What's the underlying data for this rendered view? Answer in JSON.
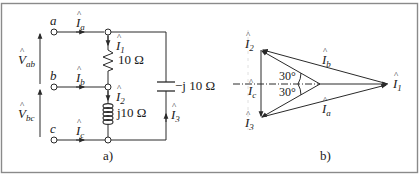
{
  "figure": {
    "panels": [
      {
        "id": "a",
        "caption": "a)",
        "type": "circuit",
        "terminals": [
          {
            "name": "a",
            "current_label": "I",
            "current_sub": "a"
          },
          {
            "name": "b",
            "current_label": "I",
            "current_sub": "b"
          },
          {
            "name": "c",
            "current_label": "I",
            "current_sub": "c"
          }
        ],
        "voltages": [
          {
            "label": "V",
            "sub": "ab"
          },
          {
            "label": "V",
            "sub": "bc"
          }
        ],
        "components": [
          {
            "kind": "resistor",
            "current_label": "I",
            "current_sub": "1",
            "value": "10 Ω"
          },
          {
            "kind": "inductor",
            "current_label": "I",
            "current_sub": "2",
            "value": "j10 Ω"
          },
          {
            "kind": "capacitor",
            "current_label": "I",
            "current_sub": "3",
            "value": "−j 10 Ω"
          }
        ]
      },
      {
        "id": "b",
        "caption": "b)",
        "type": "phasor-diagram",
        "phasors": [
          {
            "label": "I",
            "sub": "1"
          },
          {
            "label": "I",
            "sub": "2"
          },
          {
            "label": "I",
            "sub": "3"
          },
          {
            "label": "I",
            "sub": "a"
          },
          {
            "label": "I",
            "sub": "b"
          },
          {
            "label": "I",
            "sub": "c"
          }
        ],
        "angles": [
          "30°",
          "30°"
        ]
      }
    ],
    "colors": {
      "line": "#2a2a2a",
      "border": "#8a8a8a",
      "background": "#ffffff"
    }
  }
}
